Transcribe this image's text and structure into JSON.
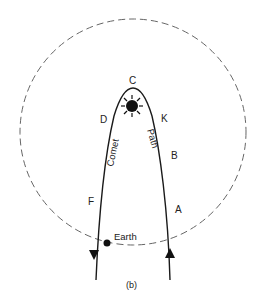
{
  "figure": {
    "caption": "(b)",
    "labels": {
      "C": "C",
      "D": "D",
      "K": "K",
      "B": "B",
      "F": "F",
      "A": "A",
      "earth": "Earth",
      "comet": "Comet",
      "path": "Path"
    },
    "elements": {
      "orbit": "dashed circle (Earth's orbit)",
      "sun": "sun-icon",
      "trajectory": "parabolic comet path",
      "arrow_left": "down-arrow",
      "arrow_right": "up-arrow"
    },
    "colors": {
      "line": "#1a1a1a",
      "dash": "#666666",
      "text": "#222222",
      "background": "#ffffff"
    }
  }
}
